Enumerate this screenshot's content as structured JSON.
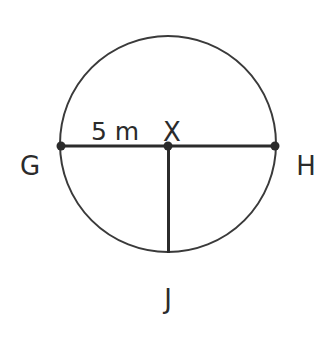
{
  "figure": {
    "background_color": "#ffffff",
    "stroke_color": "#2b2b2b",
    "circle_stroke_color": "#3a3a3a",
    "labels": {
      "left_endpoint": "G",
      "right_endpoint": "H",
      "center": "X",
      "bottom_endpoint": "J",
      "measure": "5 m"
    },
    "geometry": {
      "center_x": 168,
      "center_y": 146,
      "radius": 108,
      "circle_stroke_width": 2,
      "chord_stroke_width": 3,
      "point_radius": 4.5
    },
    "points": [
      {
        "name": "G",
        "x": 61,
        "y": 146
      },
      {
        "name": "X",
        "x": 168,
        "y": 146
      },
      {
        "name": "H",
        "x": 275,
        "y": 146
      },
      {
        "name": "J",
        "x": 168,
        "y": 253
      }
    ],
    "segments": [
      {
        "name": "diameter-GH",
        "from": "G",
        "to": "H"
      },
      {
        "name": "radius-XJ",
        "from": "X",
        "to": "J"
      }
    ],
    "measurements": [
      {
        "segment": "GX",
        "value": "5 m"
      }
    ]
  }
}
